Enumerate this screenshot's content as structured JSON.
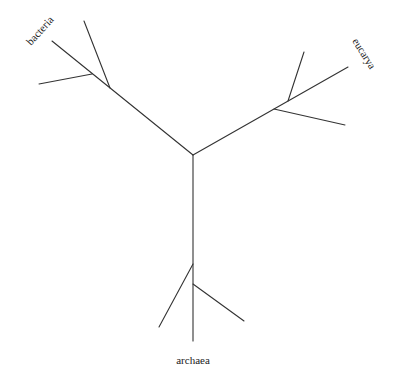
{
  "diagram": {
    "type": "unrooted phylogenetic tree",
    "labels": {
      "bacteria": "bacteria",
      "eucarya": "eucarya",
      "archaea": "archaea"
    },
    "line_color": "#333333"
  }
}
